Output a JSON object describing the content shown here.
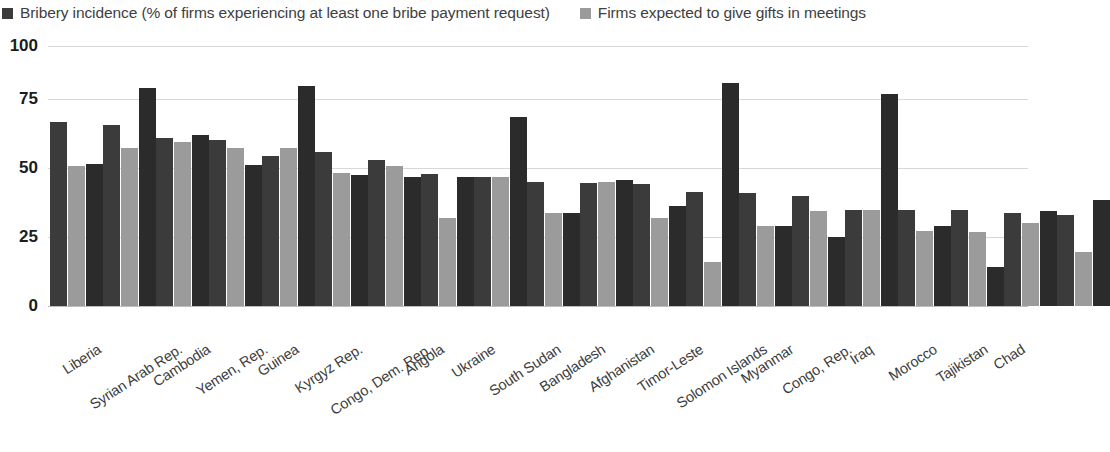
{
  "legend": {
    "position": "top-left",
    "items": [
      {
        "label": "Bribery incidence (% of firms experiencing at least one bribe payment request)",
        "color": "#3b3b3b",
        "icon": "square-swatch"
      },
      {
        "label": "Firms expected to give gifts in meetings",
        "color": "#9b9b9b",
        "icon": "square-swatch"
      }
    ]
  },
  "axis": {
    "y_ticks": [
      "0",
      "25",
      "50",
      "75",
      "100"
    ],
    "y_min": 0,
    "y_max": 100
  },
  "colors": {
    "series_dark": "#3b3b3b",
    "series_light": "#9b9b9b",
    "gridline": "#d8d8d8",
    "text": "#3d3d3d",
    "tick_text": "#1c1c1c",
    "background": "#ffffff"
  },
  "chart_data": {
    "type": "bar",
    "title": "",
    "subtitle": "",
    "xlabel": "",
    "ylabel": "",
    "ylim": [
      0,
      100
    ],
    "yticks": [
      0,
      25,
      50,
      75,
      100
    ],
    "grid": true,
    "legend_position": "top-left",
    "categories": [
      "Liberia",
      "Syrian Arab Rep.",
      "Cambodia",
      "Yemen, Rep.",
      "Guinea",
      "Kyrgyz Rep.",
      "Congo, Dem. Rep.",
      "Angola",
      "Ukraine",
      "South Sudan",
      "Bangladesh",
      "Afghanistan",
      "Timor-Leste",
      "Solomon Islands",
      "Myanmar",
      "Congo, Rep.",
      "Iraq",
      "Morocco",
      "Tajikistan",
      "Chad"
    ],
    "series": [
      {
        "name": "Bribery incidence (% of firms experiencing at least one bribe payment request)",
        "color": "#3b3b3b",
        "values": [
          71,
          70,
          65,
          64,
          58,
          59.5,
          56.5,
          51,
          50,
          48,
          47.5,
          47,
          44,
          43.5,
          42.5,
          37,
          37,
          37,
          36,
          35
        ]
      },
      {
        "name": "Firms expected to give gifts in meetings",
        "color": "#9b9b9b",
        "values": [
          54,
          61,
          63.5,
          61,
          61,
          51.5,
          54,
          34,
          50,
          36,
          48,
          34,
          17,
          31,
          36.5,
          37,
          29,
          28.5,
          32,
          21
        ]
      }
    ],
    "extra_bars": {
      "note": "Each category shows a third darker bar at the right of each pair in the source rendering",
      "values": [
        55,
        84,
        66,
        54.5,
        85,
        50.5,
        50,
        50,
        73,
        36,
        48.5,
        38.5,
        86,
        31,
        26.5,
        82,
        31,
        15,
        36.5,
        41
      ]
    }
  }
}
